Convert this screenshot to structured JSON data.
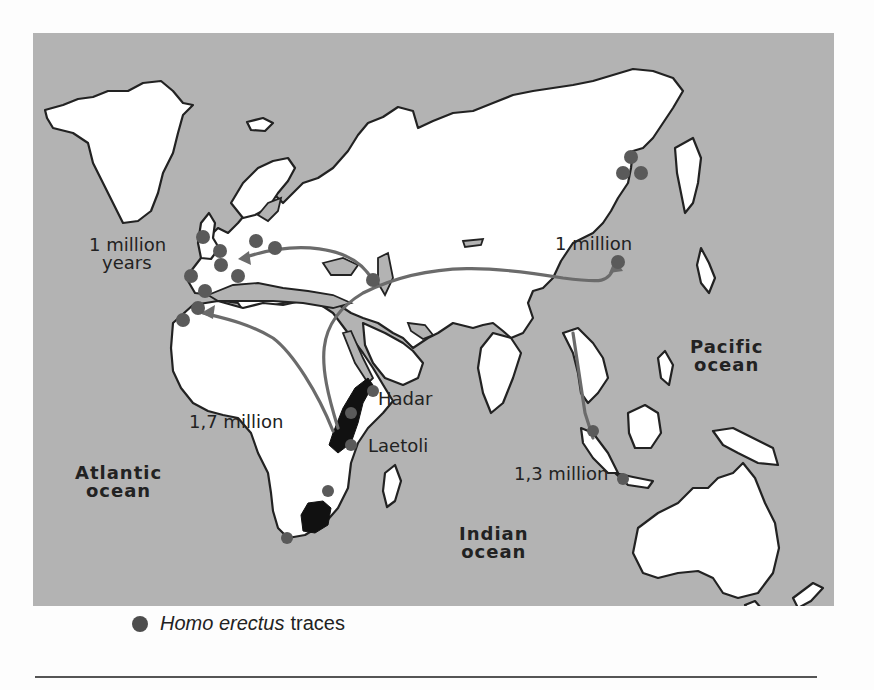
{
  "map": {
    "colors": {
      "ocean": "#b3b3b3",
      "land": "#ffffff",
      "coast": "#222222",
      "route": "#6b6b6b",
      "trace_dot": "#5a5a5a",
      "fossil_region": "#111111"
    },
    "route_labels": [
      {
        "id": "europe",
        "line1": "1 million",
        "line2": "years"
      },
      {
        "id": "china",
        "text": "1 million"
      },
      {
        "id": "africa",
        "text": "1,7 million"
      },
      {
        "id": "java",
        "text": "1,3 million"
      }
    ],
    "site_labels": [
      {
        "id": "hadar",
        "text": "Hadar"
      },
      {
        "id": "laetoli",
        "text": "Laetoli"
      }
    ],
    "ocean_labels": [
      {
        "id": "atlantic",
        "line1": "Atlantic",
        "line2": "ocean"
      },
      {
        "id": "indian",
        "line1": "Indian",
        "line2": "ocean"
      },
      {
        "id": "pacific",
        "line1": "Pacific",
        "line2": "ocean"
      }
    ],
    "legend": {
      "icon": "filled-circle",
      "italic": "Homo erectus",
      "text": "traces"
    }
  }
}
